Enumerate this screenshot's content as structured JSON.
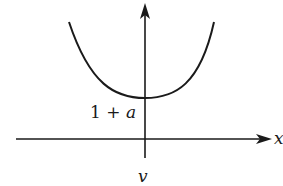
{
  "diagram": {
    "type": "function-graph",
    "curve": {
      "shape": "parabola-like (convex)",
      "minimum_label": "1 + a",
      "minimum_label_parts": {
        "constant": "1 + ",
        "variable": "a"
      }
    },
    "axes": {
      "horizontal_label": "x",
      "vertical_arrow": "up",
      "horizontal_arrow": "right"
    },
    "caption": "v",
    "colors": {
      "stroke": "#1a1a1a",
      "background": "#ffffff"
    }
  }
}
